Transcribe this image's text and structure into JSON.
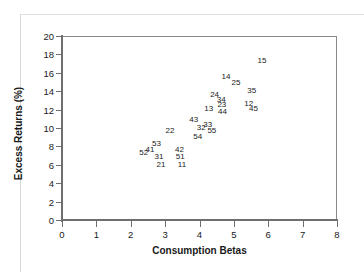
{
  "page": {
    "clipped_header_text": ""
  },
  "chart_data": {
    "type": "scatter",
    "title": "",
    "xlabel": "Consumption Betas",
    "ylabel": "Excess Returns (%)",
    "xlim": [
      0,
      8
    ],
    "ylim": [
      0,
      20
    ],
    "xticks": [
      0,
      1,
      2,
      3,
      4,
      5,
      6,
      7,
      8
    ],
    "yticks": [
      0,
      2,
      4,
      6,
      8,
      10,
      12,
      14,
      16,
      18,
      20
    ],
    "grid": false,
    "legend": false,
    "marker_style": "text-label-only",
    "points": [
      {
        "label": "52",
        "x": 2.38,
        "y": 7.4
      },
      {
        "label": "41",
        "x": 2.56,
        "y": 7.7
      },
      {
        "label": "53",
        "x": 2.75,
        "y": 8.4
      },
      {
        "label": "31",
        "x": 2.82,
        "y": 7.0
      },
      {
        "label": "21",
        "x": 2.88,
        "y": 6.1
      },
      {
        "label": "22",
        "x": 3.14,
        "y": 9.8
      },
      {
        "label": "42",
        "x": 3.42,
        "y": 7.7
      },
      {
        "label": "51",
        "x": 3.44,
        "y": 7.0
      },
      {
        "label": "11",
        "x": 3.49,
        "y": 6.1
      },
      {
        "label": "43",
        "x": 3.83,
        "y": 11.0
      },
      {
        "label": "54",
        "x": 3.95,
        "y": 9.1
      },
      {
        "label": "32",
        "x": 4.05,
        "y": 10.1
      },
      {
        "label": "33",
        "x": 4.24,
        "y": 10.4
      },
      {
        "label": "13",
        "x": 4.27,
        "y": 12.2
      },
      {
        "label": "55",
        "x": 4.36,
        "y": 9.8
      },
      {
        "label": "24",
        "x": 4.44,
        "y": 13.7
      },
      {
        "label": "34",
        "x": 4.63,
        "y": 13.2
      },
      {
        "label": "23",
        "x": 4.65,
        "y": 12.6
      },
      {
        "label": "44",
        "x": 4.67,
        "y": 11.9
      },
      {
        "label": "14",
        "x": 4.77,
        "y": 15.6
      },
      {
        "label": "25",
        "x": 5.06,
        "y": 15.0
      },
      {
        "label": "12",
        "x": 5.43,
        "y": 12.7
      },
      {
        "label": "35",
        "x": 5.52,
        "y": 14.1
      },
      {
        "label": "45",
        "x": 5.57,
        "y": 12.2
      },
      {
        "label": "15",
        "x": 5.82,
        "y": 17.4
      }
    ]
  }
}
